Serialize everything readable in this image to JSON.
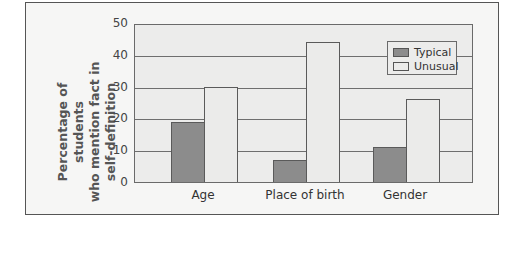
{
  "chart_data": {
    "type": "bar",
    "title": "",
    "xlabel": "",
    "ylabel": "Percentage of students who mention fact in self-definition",
    "ylabel_lines": [
      "Percentage of students",
      "who mention fact in",
      "self-definition"
    ],
    "categories": [
      "Age",
      "Place of birth",
      "Gender"
    ],
    "series": [
      {
        "name": "Typical",
        "values": [
          19,
          7,
          11
        ],
        "color": "#8c8c8c"
      },
      {
        "name": "Unusual",
        "values": [
          30,
          44,
          26
        ],
        "color": "#ebebea"
      }
    ],
    "ylim": [
      0,
      50
    ],
    "yticks": [
      0,
      10,
      20,
      30,
      40,
      50
    ],
    "grid": true,
    "legend_position": "upper right"
  }
}
